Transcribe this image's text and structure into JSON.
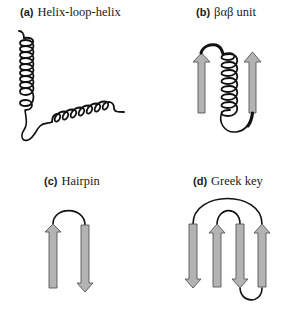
{
  "figure": {
    "panels": [
      {
        "id": "a",
        "letter": "(a)",
        "title": "Helix-loop-helix"
      },
      {
        "id": "b",
        "letter": "(b)",
        "title": "βαβ unit"
      },
      {
        "id": "c",
        "letter": "(c)",
        "title": "Hairpin"
      },
      {
        "id": "d",
        "letter": "(d)",
        "title": "Greek key"
      }
    ],
    "colors": {
      "strand_fill": "#b3b3b3",
      "strand_stroke": "#555555",
      "line": "#111111",
      "background": "#ffffff"
    }
  }
}
